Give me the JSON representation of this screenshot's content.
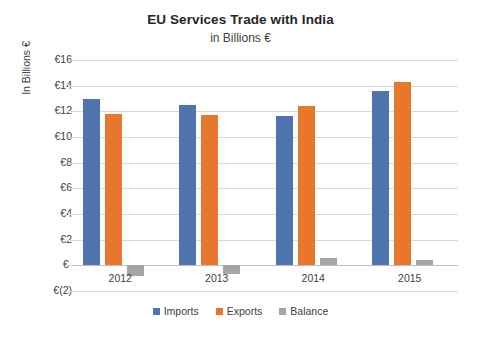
{
  "chart_data": {
    "type": "bar",
    "title": "EU Services Trade with India",
    "subtitle": "in Billions €",
    "xlabel": "",
    "ylabel": "In Billions €",
    "categories": [
      "2012",
      "2013",
      "2014",
      "2015"
    ],
    "series": [
      {
        "name": "Imports",
        "color": "#4f74ad",
        "values": [
          13.0,
          12.5,
          11.6,
          13.6
        ]
      },
      {
        "name": "Exports",
        "color": "#e8762c",
        "values": [
          11.8,
          11.7,
          12.4,
          14.3
        ]
      },
      {
        "name": "Balance",
        "color": "#a5a5a5",
        "values": [
          -0.8,
          -0.7,
          0.55,
          0.45
        ]
      }
    ],
    "ylim": [
      -2,
      16
    ],
    "ytick_values": [
      16,
      14,
      12,
      10,
      8,
      6,
      4,
      2,
      0,
      -2
    ],
    "ytick_labels": [
      "€16",
      "€14",
      "€12",
      "€10",
      "€8",
      "€6",
      "€4",
      "€2",
      "€-",
      "€(2)"
    ],
    "grid": true,
    "legend_position": "bottom"
  },
  "caption": {
    "text": ""
  },
  "colors": {
    "imports": "#4f74ad",
    "exports": "#e8762c",
    "balance": "#a5a5a5",
    "gridline": "#d9d9d9",
    "text": "#404040",
    "title": "#262626",
    "background": "#ffffff"
  }
}
